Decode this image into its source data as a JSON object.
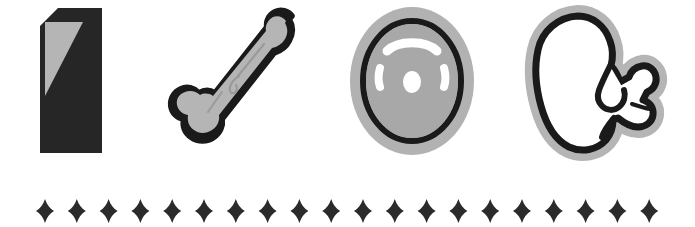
{
  "page": {
    "background_color": "#ffffff",
    "width": 695,
    "height": 227
  },
  "palette": {
    "ink": "#262626",
    "black": "#1a1a1a",
    "gray_light": "#b5b5b5",
    "gray_mid": "#a8a8a8",
    "gray_dark": "#8f8f8f",
    "white": "#ffffff",
    "diamond": "#2b2b2b"
  },
  "icon_row": {
    "count": 4,
    "icons": [
      {
        "id": "tombstone",
        "name": "tombstone-icon",
        "label": "Tombstone",
        "fill": "#262626",
        "accent": "#b5b5b5",
        "description": "Dark slab with clipped top-left corner and a light gray triangular highlight in the upper left"
      },
      {
        "id": "bone",
        "name": "bone-icon",
        "label": "Bone",
        "fill": "#b5b5b5",
        "accent": "#1a1a1a",
        "description": "Long bone angled from lower left to upper right with thick black outline"
      },
      {
        "id": "ovum",
        "name": "ovum-icon",
        "label": "Ovum",
        "fill": "#a8a8a8",
        "accent": "#1a1a1a",
        "description": "Gray oval cell with black ring, white arc highlight, two white side marks and a white central nucleus"
      },
      {
        "id": "fetus",
        "name": "fetus-icon",
        "label": "Fetus",
        "fill": "#ffffff",
        "accent": "#1a1a1a",
        "description": "Curled fetus outlined in black with a soft gray halo"
      }
    ]
  },
  "divider": {
    "name": "diamond-divider",
    "glyph": "four-pointed-star",
    "count": 20,
    "color": "#2b2b2b",
    "first_center_x": 45,
    "spacing": 31.8,
    "center_y": 211,
    "half_width": 9,
    "half_height": 12
  }
}
